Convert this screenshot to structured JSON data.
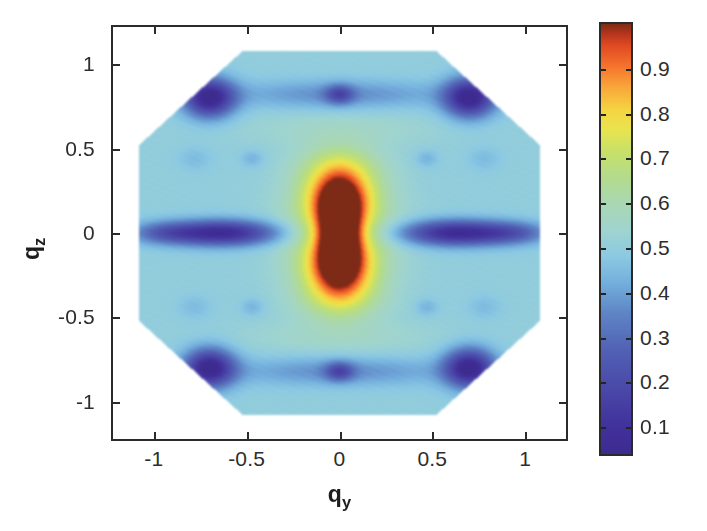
{
  "figure": {
    "background": "#ffffff",
    "axis_color": "#2b2b2b",
    "text_color": "#2d2d2d"
  },
  "axes": {
    "xlabel_main": "q",
    "xlabel_sub": "y",
    "ylabel_main": "q",
    "ylabel_sub": "z"
  },
  "chart_data": {
    "type": "heatmap",
    "title": "",
    "xlabel": "q_y",
    "ylabel": "q_z",
    "colormap": "jet",
    "grid": false,
    "legend": "colorbar-right",
    "xlim": [
      -1.22,
      1.22
    ],
    "ylim": [
      -1.22,
      1.22
    ],
    "xticks": [
      -1,
      -0.5,
      0,
      0.5,
      1
    ],
    "xtick_labels": [
      "-1",
      "-0.5",
      "0",
      "0.5",
      "1"
    ],
    "yticks": [
      -1,
      -0.5,
      0,
      0.5,
      1
    ],
    "ytick_labels": [
      "-1",
      "-0.5",
      "0",
      "0.5",
      "1"
    ],
    "colorbar": {
      "vmin": 0.04,
      "vmax": 1.0,
      "ticks": [
        0.1,
        0.2,
        0.3,
        0.4,
        0.5,
        0.6,
        0.7,
        0.8,
        0.9
      ],
      "tick_labels": [
        "0.1",
        "0.2",
        "0.3",
        "0.4",
        "0.5",
        "0.6",
        "0.7",
        "0.8",
        "0.9"
      ],
      "stops": [
        {
          "pos": 0.0,
          "color": "#3d2b8f"
        },
        {
          "pos": 0.06,
          "color": "#41309b"
        },
        {
          "pos": 0.15,
          "color": "#4a48a8"
        },
        {
          "pos": 0.24,
          "color": "#5160b4"
        },
        {
          "pos": 0.33,
          "color": "#5f86c6"
        },
        {
          "pos": 0.4,
          "color": "#74b0dd"
        },
        {
          "pos": 0.46,
          "color": "#8cc9e2"
        },
        {
          "pos": 0.52,
          "color": "#9fd4cf"
        },
        {
          "pos": 0.58,
          "color": "#a9d7b4"
        },
        {
          "pos": 0.64,
          "color": "#b2db8e"
        },
        {
          "pos": 0.7,
          "color": "#c6e06a"
        },
        {
          "pos": 0.755,
          "color": "#e8e44e"
        },
        {
          "pos": 0.8,
          "color": "#f6d441"
        },
        {
          "pos": 0.855,
          "color": "#f8a53a"
        },
        {
          "pos": 0.905,
          "color": "#f4702c"
        },
        {
          "pos": 0.95,
          "color": "#e04a22"
        },
        {
          "pos": 0.98,
          "color": "#b0331c"
        },
        {
          "pos": 1.0,
          "color": "#7d2b16"
        }
      ]
    },
    "domain_shape": "octagon",
    "domain_half_width": 1.08,
    "domain_corner_cut": 0.52,
    "features": [
      {
        "name": "central-core",
        "x": 0.0,
        "y": 0.0,
        "value": 1.0,
        "description": "dark maroon vertical I-shaped core"
      },
      {
        "name": "central-hot-lobe-upper",
        "x": 0.0,
        "y": 0.22,
        "value": 0.88,
        "description": "red-orange lobe above center"
      },
      {
        "name": "central-hot-lobe-lower",
        "x": 0.0,
        "y": -0.22,
        "value": 0.88,
        "description": "red-orange lobe below center"
      },
      {
        "name": "yellow-shoulder-upper",
        "x": 0.0,
        "y": 0.46,
        "value": 0.7,
        "description": "yellow ring top"
      },
      {
        "name": "yellow-shoulder-lower",
        "x": 0.0,
        "y": -0.46,
        "value": 0.7,
        "description": "yellow ring bottom"
      },
      {
        "name": "blue-lobe-left",
        "x": -0.62,
        "y": 0.0,
        "value": 0.13,
        "description": "elongated dark blue horizontal lobe left"
      },
      {
        "name": "blue-lobe-right",
        "x": 0.62,
        "y": 0.0,
        "value": 0.13,
        "description": "elongated dark blue horizontal lobe right"
      },
      {
        "name": "blue-corner-tl",
        "x": -0.72,
        "y": 0.8,
        "value": 0.1,
        "description": "dark blue blob top-left"
      },
      {
        "name": "blue-corner-tr",
        "x": 0.72,
        "y": 0.8,
        "value": 0.1,
        "description": "dark blue blob top-right"
      },
      {
        "name": "blue-corner-bl",
        "x": -0.72,
        "y": -0.8,
        "value": 0.1,
        "description": "dark blue blob bottom-left"
      },
      {
        "name": "blue-corner-br",
        "x": 0.72,
        "y": -0.8,
        "value": 0.1,
        "description": "dark blue blob bottom-right"
      },
      {
        "name": "violet-spot-top",
        "x": 0.0,
        "y": 0.82,
        "value": 0.3,
        "description": "small violet diamond top center"
      },
      {
        "name": "violet-spot-bottom",
        "x": 0.0,
        "y": -0.82,
        "value": 0.3,
        "description": "small violet diamond bottom center"
      },
      {
        "name": "background-field",
        "x": null,
        "y": null,
        "value": 0.5,
        "description": "green mid-level background across octagon"
      }
    ]
  }
}
